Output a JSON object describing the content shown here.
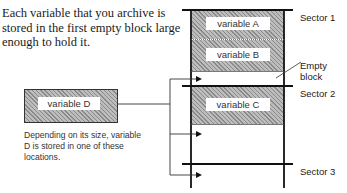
{
  "intro_text": "Each variable that you archive is stored in the first empty block large enough to hold it.",
  "note_text": "Depending on its size, variable D is stored in one of these locations.",
  "blocks": {
    "a": "variable A",
    "b": "variable B",
    "c": "variable C",
    "d": "variable D"
  },
  "sectors": [
    "Sector 1",
    "Sector 2",
    "Sector 3"
  ],
  "empty_block_label": [
    "Empty",
    "block"
  ]
}
